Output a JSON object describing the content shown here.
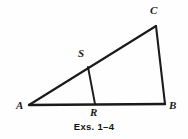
{
  "figure": {
    "caption": "Exs. 1–4",
    "stroke_color": "#1a1a1a",
    "background_color": "#fefefe",
    "points": {
      "A": {
        "label": "A",
        "x": 29,
        "y": 105,
        "label_x": 16,
        "label_y": 100
      },
      "B": {
        "label": "B",
        "x": 165,
        "y": 104,
        "label_x": 169,
        "label_y": 100
      },
      "C": {
        "label": "C",
        "x": 156,
        "y": 26,
        "label_x": 150,
        "label_y": 5
      },
      "R": {
        "label": "R",
        "x": 95,
        "y": 104,
        "label_x": 90,
        "label_y": 107
      },
      "S": {
        "label": "S",
        "x": 88,
        "y": 67,
        "label_x": 78,
        "label_y": 48
      }
    },
    "segments": [
      {
        "name": "segment-AC",
        "from": "A",
        "to": "C",
        "width": 2.1
      },
      {
        "name": "segment-CB",
        "from": "C",
        "to": "B",
        "width": 2.1
      },
      {
        "name": "segment-AB",
        "from": "A",
        "to": "B",
        "width": 2.4
      },
      {
        "name": "segment-SR",
        "from": "S",
        "to": "R",
        "width": 1.9
      }
    ]
  }
}
